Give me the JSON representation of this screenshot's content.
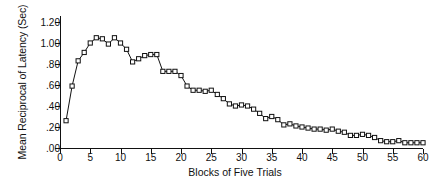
{
  "chart_data": {
    "type": "line",
    "title": "",
    "xlabel": "Blocks of Five Trials",
    "ylabel": "Mean Reciprocal of Latency (Sec)",
    "xlim": [
      0,
      60
    ],
    "ylim": [
      0.0,
      1.2
    ],
    "xticks": [
      0,
      5,
      10,
      15,
      20,
      25,
      30,
      35,
      40,
      45,
      50,
      55,
      60
    ],
    "xticklabels": [
      "0",
      "5",
      "10",
      "15",
      "20",
      "25",
      "30",
      "35",
      "40",
      "45",
      "50",
      "55",
      "60"
    ],
    "yticks": [
      0.0,
      0.2,
      0.4,
      0.6,
      0.8,
      1.0,
      1.2
    ],
    "yticklabels": [
      ".00",
      ".20",
      ".40",
      ".60",
      ".80",
      "1.00",
      "1.20"
    ],
    "grid": false,
    "legend": null,
    "marker": "open-square",
    "line_color": "#111111",
    "marker_face_color": "#ffffff",
    "marker_edge_color": "#111111",
    "x": [
      1,
      2,
      3,
      4,
      5,
      6,
      7,
      8,
      9,
      10,
      11,
      12,
      13,
      14,
      15,
      16,
      17,
      18,
      19,
      20,
      21,
      22,
      23,
      24,
      25,
      26,
      27,
      28,
      29,
      30,
      31,
      32,
      33,
      34,
      35,
      36,
      37,
      38,
      39,
      40,
      41,
      42,
      43,
      44,
      45,
      46,
      47,
      48,
      49,
      50,
      51,
      52,
      53,
      54,
      55,
      56,
      57,
      58,
      59,
      60
    ],
    "values": [
      0.26,
      0.59,
      0.83,
      0.91,
      1.0,
      1.05,
      1.04,
      0.99,
      1.05,
      1.0,
      0.94,
      0.82,
      0.85,
      0.88,
      0.89,
      0.89,
      0.73,
      0.73,
      0.73,
      0.69,
      0.59,
      0.55,
      0.55,
      0.54,
      0.55,
      0.51,
      0.47,
      0.42,
      0.4,
      0.41,
      0.4,
      0.37,
      0.33,
      0.28,
      0.3,
      0.27,
      0.22,
      0.23,
      0.21,
      0.2,
      0.19,
      0.18,
      0.18,
      0.17,
      0.18,
      0.16,
      0.15,
      0.12,
      0.12,
      0.13,
      0.12,
      0.1,
      0.07,
      0.06,
      0.06,
      0.07,
      0.05,
      0.05,
      0.05,
      0.05
    ]
  },
  "figure": {
    "axis_color": "#111111",
    "background": "#ffffff"
  }
}
